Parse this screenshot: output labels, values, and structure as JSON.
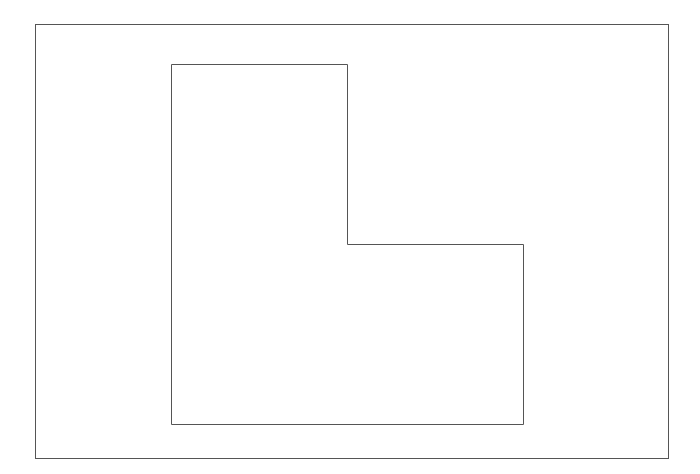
{
  "canvas": {
    "width": 700,
    "height": 474,
    "background": "#ffffff"
  },
  "stroke_color": "#555555",
  "outer_frame": {
    "x": 35,
    "y": 24,
    "width": 633,
    "height": 434
  },
  "l_shape": {
    "points": "171,64 347,64 347,244 523,244 523,424 171,424"
  }
}
